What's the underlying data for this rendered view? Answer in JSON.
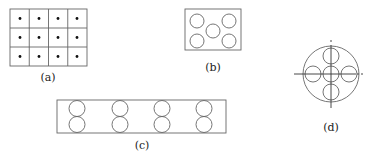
{
  "figures": {
    "a": {
      "label": "(a)",
      "grid": {
        "cols": 4,
        "rows": 3,
        "x": 10,
        "y": 9,
        "w": 77,
        "h": 57
      }
    },
    "b": {
      "label": "(b)",
      "rect": {
        "x": 185,
        "y": 9,
        "w": 56,
        "h": 41
      },
      "circles": [
        {
          "cx": 197,
          "cy": 20,
          "r": 7
        },
        {
          "cx": 229,
          "cy": 20,
          "r": 7
        },
        {
          "cx": 213,
          "cy": 30,
          "r": 7
        },
        {
          "cx": 197,
          "cy": 40,
          "r": 7
        },
        {
          "cx": 229,
          "cy": 40,
          "r": 7
        }
      ]
    },
    "c": {
      "label": "(c)",
      "rect": {
        "x": 57,
        "y": 100,
        "w": 169,
        "h": 33
      },
      "pairs_x": [
        77,
        120,
        162,
        204
      ]
    },
    "d": {
      "label": "(d)",
      "outer": {
        "cx": 331,
        "cy": 74,
        "r": 28
      }
    }
  },
  "colors": {
    "stroke": "#555555",
    "dot": "#111111",
    "text": "#222222"
  }
}
